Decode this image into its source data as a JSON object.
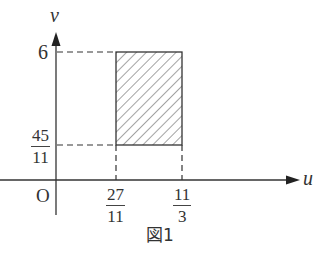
{
  "figure": {
    "caption": "図1",
    "axes": {
      "x_label": "u",
      "y_label": "v",
      "origin_label": "O"
    },
    "y_ticks": [
      {
        "label": "6",
        "value": 6
      },
      {
        "numerator": "45",
        "denominator": "11",
        "value": 4.0909
      }
    ],
    "x_ticks": [
      {
        "numerator": "27",
        "denominator": "11",
        "value": 2.4545
      },
      {
        "numerator": "11",
        "denominator": "3",
        "value": 3.6667
      }
    ],
    "region": {
      "shape": "rectangle",
      "fill": "hatched",
      "u_range": [
        "27/11",
        "11/3"
      ],
      "v_range": [
        "45/11",
        "6"
      ]
    },
    "colors": {
      "line": "#333333",
      "hatch": "#555555",
      "background": "#ffffff"
    }
  }
}
